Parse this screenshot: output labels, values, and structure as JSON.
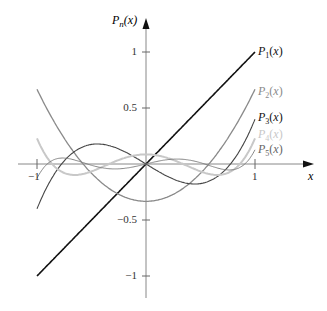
{
  "chart_data": {
    "type": "line",
    "title": "",
    "xlabel": "x",
    "ylabel": "P_n(x)",
    "xlim": [
      -1.0,
      1.0
    ],
    "ylim": [
      -1.0,
      1.0
    ],
    "x_ticks": [
      -1,
      1
    ],
    "x_tick_labels": [
      "−1",
      "1"
    ],
    "y_ticks": [
      1,
      0.5,
      -0.5,
      -1
    ],
    "y_tick_labels": [
      "1",
      "0.5",
      "−0.5",
      "−1"
    ],
    "grid": false,
    "legend_position": "right-of-curves",
    "series": [
      {
        "name": "P1(x)",
        "sub": "1",
        "color": "#111111",
        "width": 1.6,
        "coeffs": [
          0,
          1
        ],
        "end_value": 1.0
      },
      {
        "name": "P2(x)",
        "sub": "2",
        "color": "#8a8a8a",
        "width": 1.3,
        "coeffs": [
          -0.3333,
          0,
          1
        ],
        "end_value": 0.667
      },
      {
        "name": "P3(x)",
        "sub": "3",
        "color": "#444444",
        "width": 1.1,
        "coeffs": [
          0,
          -0.6,
          0,
          1
        ],
        "end_value": 0.4
      },
      {
        "name": "P4(x)",
        "sub": "4",
        "color": "#c8c8c8",
        "width": 2.0,
        "coeffs": [
          0.0857,
          0,
          -0.8571,
          0,
          1
        ],
        "end_value": 0.229
      },
      {
        "name": "P5(x)",
        "sub": "5",
        "color": "#7a7a7a",
        "width": 0.9,
        "coeffs": [
          0,
          0.2381,
          0,
          -1.1111,
          0,
          1
        ],
        "end_value": 0.127
      }
    ]
  },
  "axes": {
    "y_label_main": "P",
    "y_label_sub": "n",
    "y_label_arg": "(x)",
    "x_label": "x"
  }
}
